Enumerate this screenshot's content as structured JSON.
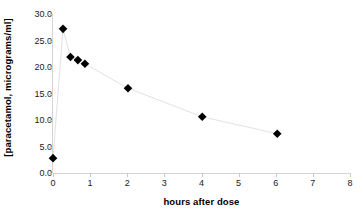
{
  "chart_data": {
    "type": "scatter",
    "title": "",
    "subtitle": "",
    "xlabel": "hours after dose",
    "ylabel": "[paracetamol, micrograms/ml]",
    "xlim": [
      0,
      8
    ],
    "ylim": [
      0,
      30
    ],
    "grid": false,
    "legend": "none",
    "marker": "diamond",
    "marker_color": "#000000",
    "line_color": "#e2e2e2",
    "x_ticks": [
      "0",
      "1",
      "2",
      "3",
      "4",
      "5",
      "6",
      "7",
      "8"
    ],
    "x_tick_values": [
      0,
      1,
      2,
      3,
      4,
      5,
      6,
      7,
      8
    ],
    "y_ticks": [
      "0.0",
      "5.0",
      "10.0",
      "15.0",
      "20.0",
      "25.0",
      "30.0"
    ],
    "y_tick_values": [
      0,
      5,
      10,
      15,
      20,
      25,
      30
    ],
    "series": [
      {
        "name": "paracetamol concentration",
        "x": [
          0,
          0.27,
          0.47,
          0.67,
          0.86,
          2.02,
          4.02,
          6.04
        ],
        "values": [
          2.8,
          27.2,
          21.9,
          21.3,
          20.6,
          16.0,
          10.6,
          7.4
        ]
      }
    ],
    "points": [
      {
        "x": 0,
        "y": 2.8
      },
      {
        "x": 0.27,
        "y": 27.2
      },
      {
        "x": 0.47,
        "y": 21.9
      },
      {
        "x": 0.67,
        "y": 21.3
      },
      {
        "x": 0.86,
        "y": 20.6
      },
      {
        "x": 2.02,
        "y": 16.0
      },
      {
        "x": 4.02,
        "y": 10.6
      },
      {
        "x": 6.04,
        "y": 7.4
      }
    ],
    "annotations": []
  }
}
